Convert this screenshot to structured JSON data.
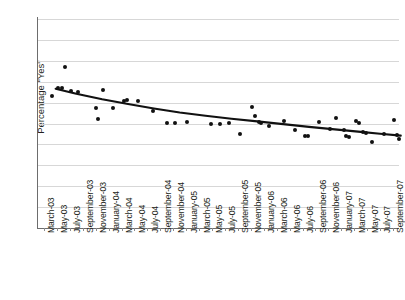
{
  "chart_data": {
    "type": "scatter",
    "title": "",
    "xlabel": "",
    "ylabel": "Percentage \"Yes\"",
    "ylim": [
      0,
      100
    ],
    "ytick_values": [
      0,
      10,
      20,
      30,
      40,
      50,
      60,
      70,
      80,
      90,
      100
    ],
    "ytick_labels": [
      "0",
      "10",
      "20",
      "30",
      "40",
      "50",
      "60",
      "70",
      "80",
      "90",
      "100"
    ],
    "grid": true,
    "legend": "none",
    "categories": [
      "March-03",
      "May-03",
      "July-03",
      "September-03",
      "November-03",
      "January-04",
      "March-04",
      "May-04",
      "July-04",
      "September-04",
      "November-04",
      "January-05",
      "March-05",
      "May-05",
      "July-05",
      "September-05",
      "November-05",
      "January-06",
      "March-06",
      "May-06",
      "July-06",
      "September-06",
      "November-06",
      "January-07",
      "March-07",
      "May-07",
      "July-07",
      "September-07"
    ],
    "series": [
      {
        "name": "Percentage \"Yes\"",
        "type": "scatter",
        "points": [
          {
            "x": 1.6,
            "y": 76.9
          },
          {
            "x": 1.1,
            "y": 66.8
          },
          {
            "x": 1.4,
            "y": 67.2
          },
          {
            "x": 0.6,
            "y": 63.3
          },
          {
            "x": 2.1,
            "y": 65.6
          },
          {
            "x": 2.6,
            "y": 65.3
          },
          {
            "x": 4.0,
            "y": 57.2
          },
          {
            "x": 4.2,
            "y": 52.0
          },
          {
            "x": 4.6,
            "y": 65.9
          },
          {
            "x": 5.3,
            "y": 57.2
          },
          {
            "x": 6.2,
            "y": 60.7
          },
          {
            "x": 6.4,
            "y": 61.2
          },
          {
            "x": 7.3,
            "y": 60.9
          },
          {
            "x": 8.4,
            "y": 56.2
          },
          {
            "x": 9.5,
            "y": 50.2
          },
          {
            "x": 10.1,
            "y": 50.1
          },
          {
            "x": 11.1,
            "y": 50.8
          },
          {
            "x": 12.9,
            "y": 50.0
          },
          {
            "x": 13.6,
            "y": 50.0
          },
          {
            "x": 14.3,
            "y": 50.2
          },
          {
            "x": 16.1,
            "y": 57.8
          },
          {
            "x": 16.3,
            "y": 53.8
          },
          {
            "x": 16.6,
            "y": 50.5
          },
          {
            "x": 16.8,
            "y": 50.3
          },
          {
            "x": 17.4,
            "y": 48.9
          },
          {
            "x": 15.2,
            "y": 45.1
          },
          {
            "x": 18.6,
            "y": 51.2
          },
          {
            "x": 19.4,
            "y": 47.0
          },
          {
            "x": 20.2,
            "y": 44.2
          },
          {
            "x": 20.4,
            "y": 44.1
          },
          {
            "x": 21.3,
            "y": 50.8
          },
          {
            "x": 22.1,
            "y": 47.5
          },
          {
            "x": 22.6,
            "y": 52.8
          },
          {
            "x": 23.2,
            "y": 47.0
          },
          {
            "x": 23.4,
            "y": 44.0
          },
          {
            "x": 23.6,
            "y": 43.7
          },
          {
            "x": 24.1,
            "y": 51.4
          },
          {
            "x": 24.4,
            "y": 50.2
          },
          {
            "x": 24.7,
            "y": 46.0
          },
          {
            "x": 24.9,
            "y": 45.6
          },
          {
            "x": 25.4,
            "y": 41.0
          },
          {
            "x": 26.3,
            "y": 45.0
          },
          {
            "x": 27.1,
            "y": 51.7
          },
          {
            "x": 27.3,
            "y": 44.5
          },
          {
            "x": 27.5,
            "y": 42.4
          }
        ]
      },
      {
        "name": "trend",
        "type": "line",
        "points": [
          {
            "x": 0.9,
            "y": 66.6
          },
          {
            "x": 2.5,
            "y": 64.2
          },
          {
            "x": 4.5,
            "y": 61.6
          },
          {
            "x": 6.5,
            "y": 59.3
          },
          {
            "x": 8.5,
            "y": 57.2
          },
          {
            "x": 10.5,
            "y": 55.3
          },
          {
            "x": 12.5,
            "y": 53.7
          },
          {
            "x": 14.5,
            "y": 52.3
          },
          {
            "x": 16.5,
            "y": 51.0
          },
          {
            "x": 18.5,
            "y": 49.7
          },
          {
            "x": 20.5,
            "y": 48.4
          },
          {
            "x": 22.5,
            "y": 47.2
          },
          {
            "x": 24.5,
            "y": 46.0
          },
          {
            "x": 26.0,
            "y": 45.1
          },
          {
            "x": 27.6,
            "y": 44.2
          }
        ]
      }
    ]
  }
}
